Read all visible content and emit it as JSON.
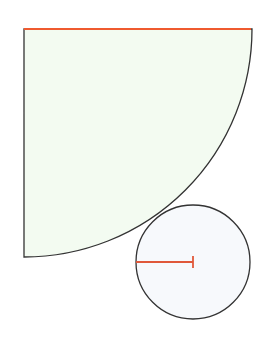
{
  "diagram": {
    "canvas": {
      "width": 271,
      "height": 341,
      "background": "#ffffff"
    },
    "sector": {
      "type": "quarter-circle",
      "center": [
        24,
        29
      ],
      "radius": 228,
      "fill": "#f3fbf1",
      "stroke": "#333333",
      "highlighted_radius": {
        "from": [
          24,
          29
        ],
        "to": [
          251,
          29
        ],
        "color": "#ef5a2f"
      }
    },
    "circle": {
      "center": [
        193,
        262
      ],
      "radius": 57,
      "fill": "#f7f9fc",
      "stroke": "#333333",
      "radius_marker": {
        "from": [
          136,
          262
        ],
        "to": [
          193,
          262
        ],
        "color": "#e0583a",
        "end_tick": true
      }
    },
    "relationship": "circle externally tangent to quarter-circle arc"
  }
}
